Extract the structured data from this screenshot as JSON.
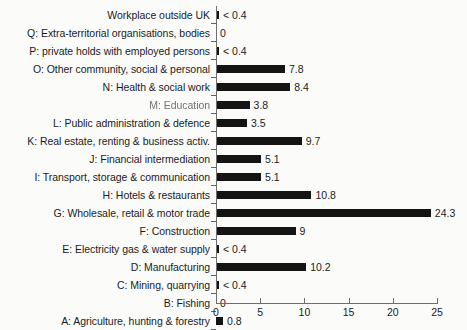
{
  "chart_data": {
    "type": "bar",
    "orientation": "horizontal",
    "title": "",
    "subtitle": "",
    "xlabel": "",
    "ylabel": "",
    "xlim": [
      0,
      25
    ],
    "xticks": [
      0,
      5,
      10,
      15,
      20,
      25
    ],
    "xtick_labels": [
      "0",
      "5",
      "10",
      "15",
      "20",
      "25"
    ],
    "grid": false,
    "legend": null,
    "bar_color": "#141414",
    "axis_color": "#6e6e6e",
    "background": "#fbfbfa",
    "categories": [
      "Workplace outside UK",
      "Q: Extra-territorial organisations, bodies",
      "P: private holds with employed persons",
      "O: Other community, social & personal",
      "N: Health & social work",
      "M: Education",
      "L: Public administration & defence",
      "K: Real estate, renting & business activ.",
      "J: Financial intermediation",
      "I: Transport, storage & communication",
      "H: Hotels & restaurants",
      "G: Wholesale, retail & motor trade",
      "F: Construction",
      "E: Electricity gas & water supply",
      "D: Manufacturing",
      "C: Mining, quarrying",
      "B: Fishing",
      "A: Agriculture, hunting & forestry"
    ],
    "values": [
      0.2,
      0,
      0.2,
      7.8,
      8.4,
      3.8,
      3.5,
      9.7,
      5.1,
      5.1,
      10.8,
      24.3,
      9,
      0.2,
      10.2,
      0.2,
      0,
      0.8
    ],
    "value_labels": [
      "< 0.4",
      "0",
      "< 0.4",
      "7.8",
      "8.4",
      "3.8",
      "3.5",
      "9.7",
      "5.1",
      "5.1",
      "10.8",
      "24.3",
      "9",
      "< 0.4",
      "10.2",
      "< 0.4",
      "0",
      "0.8"
    ],
    "bars": [
      {
        "label": "Workplace outside UK",
        "value": 0.2,
        "value_label": "< 0.4",
        "degraded_label": false
      },
      {
        "label": "Q: Extra-territorial organisations, bodies",
        "value": 0,
        "value_label": "0",
        "degraded_label": false
      },
      {
        "label": "P: private holds with employed persons",
        "value": 0.2,
        "value_label": "< 0.4",
        "degraded_label": false
      },
      {
        "label": "O: Other community, social & personal",
        "value": 7.8,
        "value_label": "7.8",
        "degraded_label": false
      },
      {
        "label": "N: Health & social work",
        "value": 8.4,
        "value_label": "8.4",
        "degraded_label": false
      },
      {
        "label": "M: Education",
        "value": 3.8,
        "value_label": "3.8",
        "degraded_label": true
      },
      {
        "label": "L: Public administration & defence",
        "value": 3.5,
        "value_label": "3.5",
        "degraded_label": false
      },
      {
        "label": "K: Real estate, renting & business activ.",
        "value": 9.7,
        "value_label": "9.7",
        "degraded_label": false
      },
      {
        "label": "J: Financial intermediation",
        "value": 5.1,
        "value_label": "5.1",
        "degraded_label": false
      },
      {
        "label": "I: Transport, storage & communication",
        "value": 5.1,
        "value_label": "5.1",
        "degraded_label": false
      },
      {
        "label": "H: Hotels & restaurants",
        "value": 10.8,
        "value_label": "10.8",
        "degraded_label": false
      },
      {
        "label": "G: Wholesale, retail & motor trade",
        "value": 24.3,
        "value_label": "24.3",
        "degraded_label": false
      },
      {
        "label": "F: Construction",
        "value": 9,
        "value_label": "9",
        "degraded_label": false
      },
      {
        "label": "E: Electricity gas & water supply",
        "value": 0.2,
        "value_label": "< 0.4",
        "degraded_label": false
      },
      {
        "label": "D: Manufacturing",
        "value": 10.2,
        "value_label": "10.2",
        "degraded_label": false
      },
      {
        "label": "C: Mining, quarrying",
        "value": 0.2,
        "value_label": "< 0.4",
        "degraded_label": false
      },
      {
        "label": "B: Fishing",
        "value": 0,
        "value_label": "0",
        "degraded_label": false
      },
      {
        "label": "A: Agriculture, hunting & forestry",
        "value": 0.8,
        "value_label": "0.8",
        "degraded_label": false
      }
    ]
  }
}
